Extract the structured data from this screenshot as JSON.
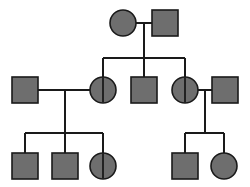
{
  "diagram": {
    "type": "pedigree-chart",
    "title": "",
    "canvas": {
      "width": 250,
      "height": 187,
      "background": "#ffffff"
    },
    "style": {
      "fill": "#6e6e6e",
      "stroke": "#1a1a1a",
      "line_color": "#1a1a1a",
      "shape_stroke_width": 1.6,
      "line_stroke_width": 1.3,
      "symbol_size": 26
    },
    "legend": {
      "male_symbol": "square",
      "female_symbol": "circle",
      "affected_fill": "#6e6e6e",
      "carrier_marker": "vertical-bar"
    },
    "generations": [
      {
        "id": "I",
        "label": "",
        "individuals": [
          {
            "id": "I-1",
            "sex": "female",
            "shape": "circle",
            "status": "filled",
            "carrier": false,
            "cx": 123,
            "cy": 23
          },
          {
            "id": "I-2",
            "sex": "male",
            "shape": "square",
            "status": "filled",
            "carrier": false,
            "cx": 165,
            "cy": 23
          }
        ]
      },
      {
        "id": "II",
        "label": "",
        "individuals": [
          {
            "id": "II-1",
            "sex": "male",
            "shape": "square",
            "status": "filled",
            "carrier": false,
            "cx": 25,
            "cy": 90
          },
          {
            "id": "II-2",
            "sex": "female",
            "shape": "circle",
            "status": "filled",
            "carrier": true,
            "cx": 103,
            "cy": 90
          },
          {
            "id": "II-3",
            "sex": "male",
            "shape": "square",
            "status": "filled",
            "carrier": false,
            "cx": 144,
            "cy": 90
          },
          {
            "id": "II-4",
            "sex": "female",
            "shape": "circle",
            "status": "filled",
            "carrier": true,
            "cx": 185,
            "cy": 90
          },
          {
            "id": "II-5",
            "sex": "male",
            "shape": "square",
            "status": "filled",
            "carrier": false,
            "cx": 225,
            "cy": 90
          }
        ]
      },
      {
        "id": "III",
        "label": "",
        "individuals": [
          {
            "id": "III-1",
            "sex": "male",
            "shape": "square",
            "status": "filled",
            "carrier": false,
            "cx": 25,
            "cy": 166
          },
          {
            "id": "III-2",
            "sex": "male",
            "shape": "square",
            "status": "filled",
            "carrier": false,
            "cx": 65,
            "cy": 166
          },
          {
            "id": "III-3",
            "sex": "female",
            "shape": "circle",
            "status": "filled",
            "carrier": true,
            "cx": 103,
            "cy": 166
          },
          {
            "id": "III-4",
            "sex": "male",
            "shape": "square",
            "status": "filled",
            "carrier": false,
            "cx": 185,
            "cy": 166
          },
          {
            "id": "III-5",
            "sex": "female",
            "shape": "circle",
            "status": "filled",
            "carrier": false,
            "cx": 224,
            "cy": 166
          }
        ]
      }
    ],
    "matings": [
      {
        "id": "mating-1",
        "partners": [
          "I-1",
          "I-2"
        ],
        "line_y": 23,
        "x1": 136,
        "x2": 152,
        "descent_x": 144,
        "descent_to_y": 58
      },
      {
        "id": "mating-2",
        "partners": [
          "II-1",
          "II-2"
        ],
        "line_y": 90,
        "x1": 38,
        "x2": 90,
        "descent_x": 65,
        "descent_to_y": 133
      },
      {
        "id": "mating-3",
        "partners": [
          "II-4",
          "II-5"
        ],
        "line_y": 90,
        "x1": 198,
        "x2": 212,
        "descent_x": 205,
        "descent_to_y": 133
      }
    ],
    "sibships": [
      {
        "id": "sibship-1",
        "parents": "mating-1",
        "bar_y": 58,
        "x_start": 103,
        "x_end": 185,
        "children_x": [
          103,
          144,
          185
        ],
        "child_top_y": 77
      },
      {
        "id": "sibship-2",
        "parents": "mating-2",
        "bar_y": 133,
        "x_start": 25,
        "x_end": 103,
        "children_x": [
          25,
          65,
          103
        ],
        "child_top_y": 153
      },
      {
        "id": "sibship-3",
        "parents": "mating-3",
        "bar_y": 133,
        "x_start": 185,
        "x_end": 224,
        "children_x": [
          185,
          224
        ],
        "child_top_y": 153
      }
    ]
  }
}
